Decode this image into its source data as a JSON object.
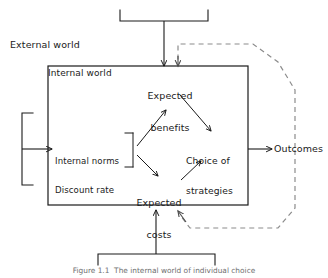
{
  "figure": {
    "caption": "Figure 1.1  The internal world of individual choice",
    "colors": {
      "stroke": "#1a1a1a",
      "dashed_stroke": "#8c8c8c",
      "text": "#1a1a1a",
      "caption_text": "#6f6f6f",
      "background": "#ffffff"
    }
  },
  "regions": {
    "external_world_label": "External world",
    "internal_world_label": "Internal world"
  },
  "nodes": {
    "expected_benefits": {
      "line1": "Expected",
      "line2": "benefits"
    },
    "internal_norms": {
      "line1": "Internal norms",
      "line2": "Discount rate"
    },
    "choice_of_strategies": {
      "line1": "Choice of",
      "line2": "strategies"
    },
    "expected_costs": {
      "line1": "Expected",
      "line2": "costs"
    },
    "outcomes": {
      "label": "Outcomes"
    }
  },
  "connectors": {
    "top_bracket": "top-input-bracket",
    "left_bracket": "left-input-bracket",
    "bottom_bracket": "bottom-input-bracket",
    "norms_to_benefits": "solid-arrow",
    "norms_to_costs": "solid-arrow",
    "benefits_to_choice": "solid-arrow",
    "costs_to_choice": "solid-arrow",
    "choice_to_outcomes": "solid-arrow",
    "feedback_top": "dashed-arrow",
    "feedback_bottom": "dashed-arrow"
  }
}
